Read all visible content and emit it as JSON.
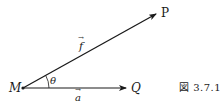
{
  "figure": {
    "caption": "図 3.7.1",
    "points": {
      "M": {
        "label": "M",
        "x": 23,
        "y": 88
      },
      "P": {
        "label": "P",
        "x": 157,
        "y": 13
      },
      "Q": {
        "label": "Q",
        "x": 127,
        "y": 88
      }
    },
    "vectors": [
      {
        "name": "f",
        "label": "f",
        "arrow": "→",
        "from": "M",
        "to": "P"
      },
      {
        "name": "a",
        "label": "a",
        "arrow": "→",
        "from": "M",
        "to": "Q"
      }
    ],
    "angle": {
      "label": "θ",
      "between": [
        "a",
        "f"
      ]
    },
    "stroke_color": "#1a1a1a"
  }
}
